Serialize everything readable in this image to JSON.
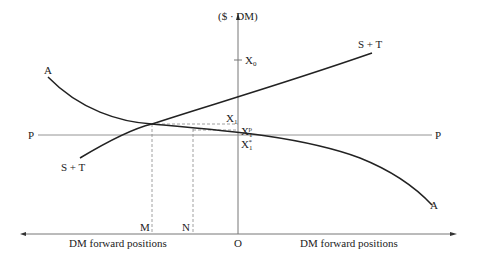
{
  "diagram": {
    "y_axis_label": "($ · DM)",
    "x_axis_left_label": "DM forward positions",
    "x_axis_right_label": "DM forward positions",
    "origin_label": "O",
    "curves": {
      "A_left": "A",
      "A_right": "A",
      "ST_left": "S + T",
      "ST_right": "S + T",
      "P_left": "P",
      "P_right": "P"
    },
    "y_markers": {
      "x0": "X",
      "x0_sub": "0",
      "x1": "X",
      "x1_sub": "1",
      "x1p": "X",
      "x1p_sub": "1",
      "x1p_sup": "p",
      "x1star": "X",
      "x1star_sub": "1",
      "x1star_sup": "*"
    },
    "x_markers": {
      "m": "M",
      "n": "N"
    }
  },
  "colors": {
    "line": "#222222",
    "axis": "#666666",
    "thin": "#888888"
  }
}
